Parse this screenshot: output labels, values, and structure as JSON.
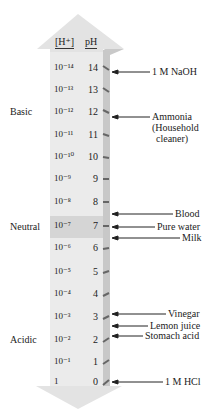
{
  "headers": {
    "concentration": "[H⁺]",
    "ph": "pH"
  },
  "rows": [
    {
      "h": "10⁻¹⁴",
      "ph": "14",
      "y": 68
    },
    {
      "h": "10⁻¹³",
      "ph": "13",
      "y": 90
    },
    {
      "h": "10⁻¹²",
      "ph": "12",
      "y": 112
    },
    {
      "h": "10⁻¹¹",
      "ph": "11",
      "y": 135
    },
    {
      "h": "10⁻¹⁰",
      "ph": "10",
      "y": 157
    },
    {
      "h": "10⁻⁹",
      "ph": "9",
      "y": 179
    },
    {
      "h": "10⁻⁸",
      "ph": "8",
      "y": 202
    },
    {
      "h": "10⁻⁷",
      "ph": "7",
      "y": 226
    },
    {
      "h": "10⁻⁶",
      "ph": "6",
      "y": 248
    },
    {
      "h": "10⁻⁵",
      "ph": "5",
      "y": 272
    },
    {
      "h": "10⁻⁴",
      "ph": "4",
      "y": 294
    },
    {
      "h": "10⁻³",
      "ph": "3",
      "y": 317
    },
    {
      "h": "10⁻²",
      "ph": "2",
      "y": 340
    },
    {
      "h": "10⁻¹",
      "ph": "1",
      "y": 362
    },
    {
      "h": "1",
      "ph": "0",
      "y": 382
    }
  ],
  "regions": {
    "basic": "Basic",
    "neutral": "Neutral",
    "acidic": "Acidic"
  },
  "annotations": [
    {
      "id": "naoh",
      "label": "1 M NaOH",
      "y": 72
    },
    {
      "id": "ammonia",
      "label": "Ammonia",
      "sub1": "(Household",
      "sub2": "cleaner)",
      "y": 117
    },
    {
      "id": "blood",
      "label": "Blood",
      "y": 214
    },
    {
      "id": "pure-water",
      "label": "Pure water",
      "y": 227
    },
    {
      "id": "milk",
      "label": "Milk",
      "y": 238
    },
    {
      "id": "vinegar",
      "label": "Vinegar",
      "y": 314
    },
    {
      "id": "lemon-juice",
      "label": "Lemon juice",
      "y": 326
    },
    {
      "id": "stomach-acid",
      "label": "Stomach acid",
      "y": 336
    },
    {
      "id": "hcl",
      "label": "1 M HCl",
      "y": 382
    }
  ],
  "colors": {
    "arrow_body": "#e9e9e9",
    "arrow_shade": "#c9c9c9",
    "neutral_band": "#d6d6d6",
    "text": "#222222"
  }
}
